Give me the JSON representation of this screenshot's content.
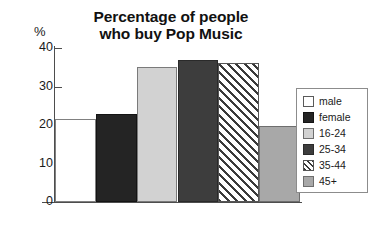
{
  "chart_data": {
    "type": "bar",
    "title": "Percentage of people who buy Pop Music",
    "title_lines": [
      "Percentage of people",
      "who buy Pop Music"
    ],
    "xlabel": "",
    "ylabel": "%",
    "ylim": [
      0,
      40
    ],
    "yticks": [
      0,
      10,
      20,
      30,
      40
    ],
    "ytick_labels": [
      "0",
      "10",
      "20",
      "30",
      "40"
    ],
    "grid": false,
    "legend_position": "right",
    "categories": [
      "male",
      "female",
      "16-24",
      "25-34",
      "35-44",
      "45+"
    ],
    "values": [
      21.5,
      22.8,
      35.0,
      37.0,
      36.0,
      19.8
    ],
    "bars": [
      {
        "label": "male",
        "value": 21.5,
        "style": "fill-white",
        "color": "#ffffff"
      },
      {
        "label": "female",
        "value": 22.8,
        "style": "fill-black",
        "color": "#242424"
      },
      {
        "label": "16-24",
        "value": 35.0,
        "style": "fill-light",
        "color": "#d2d2d2"
      },
      {
        "label": "25-34",
        "value": 37.0,
        "style": "fill-dark",
        "color": "#3d3d3d"
      },
      {
        "label": "35-44",
        "value": 36.0,
        "style": "fill-hatch",
        "color": "#ffffff"
      },
      {
        "label": "45+",
        "value": 19.8,
        "style": "fill-medium",
        "color": "#a8a8a8"
      }
    ],
    "legend": [
      {
        "label": "male",
        "style": "fill-white"
      },
      {
        "label": "female",
        "style": "fill-black"
      },
      {
        "label": "16-24",
        "style": "fill-light"
      },
      {
        "label": "25-34",
        "style": "fill-dark"
      },
      {
        "label": "35-44",
        "style": "fill-hatch"
      },
      {
        "label": "45+",
        "style": "fill-medium"
      }
    ]
  }
}
